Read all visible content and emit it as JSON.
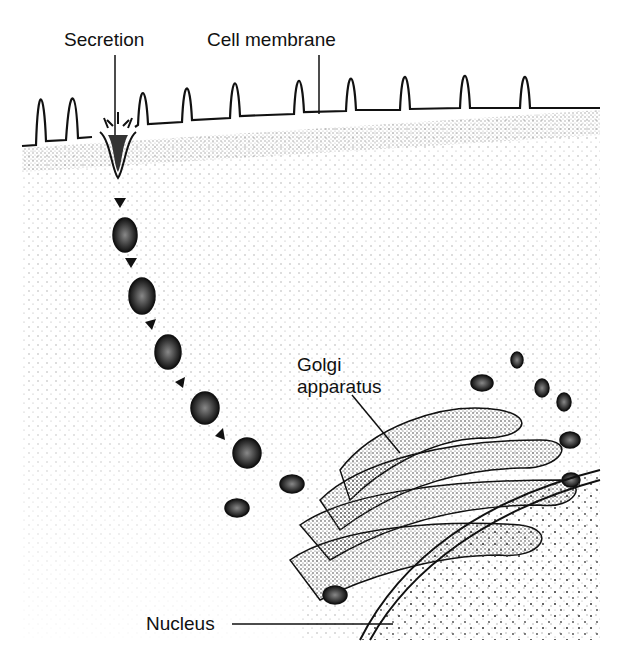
{
  "labels": {
    "secretion": "Secretion",
    "cell_membrane": "Cell membrane",
    "golgi_line1": "Golgi",
    "golgi_line2": "apparatus",
    "nucleus": "Nucleus"
  },
  "colors": {
    "ink": "#111111",
    "background": "#ffffff",
    "stipple": "#555555",
    "vesicle": "#333333"
  }
}
